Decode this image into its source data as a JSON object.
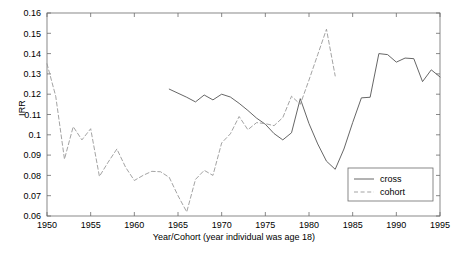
{
  "chart_data": {
    "type": "line",
    "title": "",
    "xlabel": "Year/Cohort (year individual was age 18)",
    "ylabel": "IRR",
    "xlim": [
      1950,
      1995
    ],
    "ylim": [
      0.06,
      0.16
    ],
    "xticks": [
      1950,
      1955,
      1960,
      1965,
      1970,
      1975,
      1980,
      1985,
      1990,
      1995
    ],
    "xtick_labels": [
      "1950",
      "1955",
      "1960",
      "1965",
      "1970",
      "1975",
      "1980",
      "1985",
      "1990",
      "1995"
    ],
    "yticks": [
      0.06,
      0.07,
      0.08,
      0.09,
      0.1,
      0.11,
      0.12,
      0.13,
      0.14,
      0.15,
      0.16
    ],
    "ytick_labels": [
      "0.06",
      "0.07",
      "0.08",
      "0.09",
      "0.1",
      "0.11",
      "0.12",
      "0.13",
      "0.14",
      "0.15",
      "0.16"
    ],
    "grid": false,
    "legend_position": "lower right",
    "legend_entries": [
      "cross",
      "cohort"
    ],
    "series": [
      {
        "name": "cross",
        "style": "solid",
        "color": "#555555",
        "x": [
          1964,
          1965,
          1966,
          1967,
          1968,
          1969,
          1970,
          1971,
          1972,
          1973,
          1974,
          1975,
          1976,
          1977,
          1978,
          1979,
          1980,
          1981,
          1982,
          1983,
          1984,
          1985,
          1986,
          1987,
          1988,
          1989,
          1990,
          1991,
          1992,
          1993,
          1994,
          1995
        ],
        "y": [
          0.1225,
          0.1205,
          0.1185,
          0.1162,
          0.1196,
          0.1172,
          0.12,
          0.1186,
          0.1155,
          0.112,
          0.1082,
          0.1052,
          0.1006,
          0.0975,
          0.101,
          0.1178,
          0.1055,
          0.0955,
          0.087,
          0.083,
          0.093,
          0.106,
          0.1182,
          0.1185,
          0.14,
          0.1395,
          0.1358,
          0.1378,
          0.1375,
          0.1262,
          0.132,
          0.1285
        ]
      },
      {
        "name": "cohort",
        "style": "dashed",
        "color": "#999999",
        "x": [
          1950,
          1951,
          1952,
          1953,
          1954,
          1955,
          1956,
          1957,
          1958,
          1959,
          1960,
          1961,
          1962,
          1963,
          1964,
          1965,
          1966,
          1967,
          1968,
          1969,
          1970,
          1971,
          1972,
          1973,
          1974,
          1975,
          1976,
          1977,
          1978,
          1979,
          1980,
          1981,
          1982,
          1983
        ],
        "y": [
          0.135,
          0.119,
          0.088,
          0.104,
          0.0975,
          0.103,
          0.0795,
          0.0865,
          0.093,
          0.084,
          0.0775,
          0.08,
          0.082,
          0.0818,
          0.079,
          0.07,
          0.062,
          0.078,
          0.0825,
          0.08,
          0.096,
          0.1005,
          0.109,
          0.1025,
          0.106,
          0.1055,
          0.1045,
          0.1085,
          0.119,
          0.115,
          0.127,
          0.1395,
          0.152,
          0.129
        ]
      }
    ]
  },
  "axis": {
    "y_label_text": "IRR",
    "x_label_text": "Year/Cohort (year individual was age 18)"
  },
  "legend": {
    "cross_label": "cross",
    "cohort_label": "cohort"
  }
}
